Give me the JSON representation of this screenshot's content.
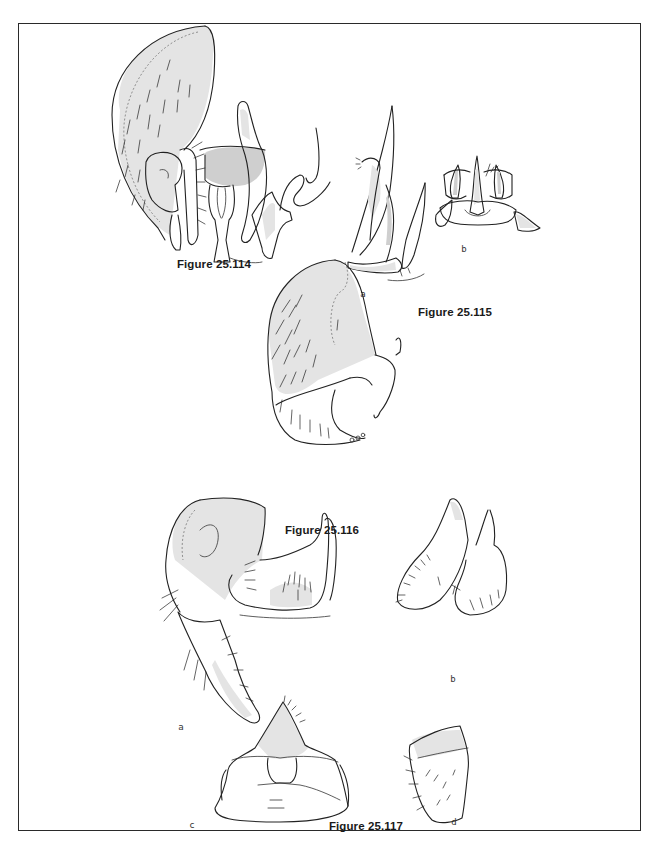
{
  "page": {
    "background": "#ffffff",
    "frame_color": "#2a2a2a"
  },
  "figures": [
    {
      "id": "fig-25-114",
      "caption": "Figure 25.114",
      "sublabels": []
    },
    {
      "id": "fig-25-115",
      "caption": "Figure 25.115",
      "sublabels": [
        "a",
        "b"
      ]
    },
    {
      "id": "fig-25-116",
      "caption": "Figure 25.116",
      "sublabels": []
    },
    {
      "id": "fig-25-117",
      "caption": "Figure 25.117",
      "sublabels": [
        "a",
        "b",
        "c",
        "d"
      ]
    }
  ]
}
